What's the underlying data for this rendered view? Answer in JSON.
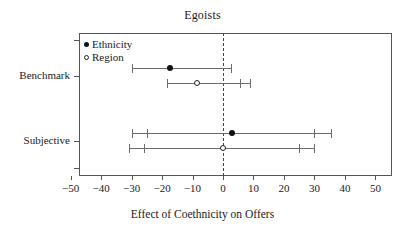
{
  "chart_data": {
    "type": "scatter",
    "title": "Egoists",
    "xlabel": "Effect of Coethnicity on Offers",
    "ylabel": "",
    "xlim": [
      -55,
      55
    ],
    "xticks": [
      -50,
      -40,
      -30,
      -20,
      -10,
      0,
      10,
      20,
      30,
      40,
      50
    ],
    "xtick_labels": [
      "−50",
      "−40",
      "−30",
      "−20",
      "−10",
      "0",
      "10",
      "20",
      "30",
      "40",
      "50"
    ],
    "grid": false,
    "reference_line": 0,
    "reference_line_style": "dashed",
    "legend": {
      "position": "top-left-inside",
      "entries": [
        {
          "label": "Ethnicity",
          "marker": "filled-circle"
        },
        {
          "label": "Region",
          "marker": "open-circle"
        }
      ]
    },
    "groups": [
      {
        "label": "Benchmark",
        "estimates": [
          {
            "series": "Ethnicity",
            "marker": "filled-circle",
            "estimate": -17.5,
            "ci_outer": [
              -30.0,
              2.5
            ],
            "ci_inner": [
              -30.0,
              2.5
            ]
          },
          {
            "series": "Region",
            "marker": "open-circle",
            "estimate": -8.5,
            "ci_outer": [
              -18.5,
              9.0
            ],
            "ci_inner": [
              -18.5,
              5.5
            ]
          }
        ]
      },
      {
        "label": "Subjective",
        "estimates": [
          {
            "series": "Ethnicity",
            "marker": "filled-circle",
            "estimate": 3.0,
            "ci_outer": [
              -30.0,
              35.5
            ],
            "ci_inner": [
              -25.0,
              30.0
            ]
          },
          {
            "series": "Region",
            "marker": "open-circle",
            "estimate": 0.0,
            "ci_outer": [
              -31.0,
              30.0
            ],
            "ci_inner": [
              -26.0,
              25.0
            ]
          }
        ]
      }
    ],
    "colors": {
      "line": "#6a6a6a",
      "marker": "#111111",
      "frame": "#555555",
      "reference": "#444444",
      "background": "#ffffff"
    }
  }
}
